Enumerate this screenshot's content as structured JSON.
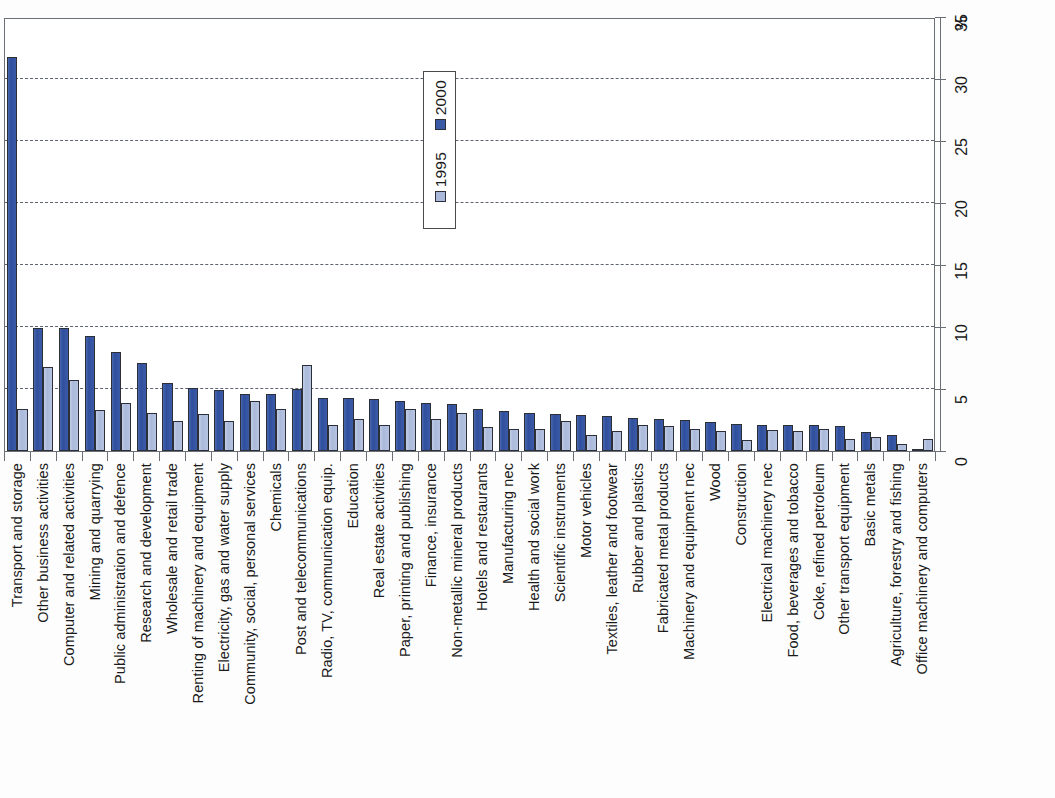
{
  "chart_data": {
    "type": "bar",
    "title": "",
    "subtitle": "",
    "xlabel": "",
    "ylabel": "%",
    "ylim": [
      0,
      35
    ],
    "yticks": [
      0,
      5,
      10,
      15,
      20,
      25,
      30,
      35
    ],
    "ytick_labels": [
      "0",
      "5",
      "10",
      "15",
      "20",
      "25",
      "30",
      "35"
    ],
    "grid": true,
    "grid_axis": "y",
    "orientation": "vertical-rotated-labels",
    "legend": {
      "position": "top-center-inside",
      "entries": [
        {
          "name": "2000",
          "color": "#3b5aa6"
        },
        {
          "name": "1995",
          "color": "#aab9da"
        }
      ]
    },
    "categories": [
      "Transport and storage",
      "Other business activities",
      "Computer and related activities",
      "Mining and quarrying",
      "Public administration and defence",
      "Research and development",
      "Wholesale and retail trade",
      "Renting of machinery and equipment",
      "Electricity, gas and water supply",
      "Community, social, personal services",
      "Chemicals",
      "Post and telecommunications",
      "Radio, TV, communication equip.",
      "Education",
      "Real estate activities",
      "Paper, printing and publishing",
      "Finance, insurance",
      "Non-metallic mineral products",
      "Hotels and restaurants",
      "Manufacturing nec",
      "Health and social work",
      "Scientific instruments",
      "Motor vehicles",
      "Textiles, leather and footwear",
      "Rubber and plastics",
      "Fabricated metal products",
      "Machinery and equipment nec",
      "Wood",
      "Construction",
      "Electrical machinery nec",
      "Food, beverages and tobacco",
      "Coke, refined petroleum",
      "Other transport equipment",
      "Basic metals",
      "Agriculture, forestry and fishing",
      "Office machinery and computers"
    ],
    "series": [
      {
        "name": "2000",
        "color": "#3b5aa6",
        "values": [
          31.8,
          9.9,
          9.9,
          9.3,
          8.0,
          7.1,
          5.5,
          5.1,
          4.9,
          4.6,
          4.6,
          5.0,
          4.3,
          4.3,
          4.2,
          4.0,
          3.9,
          3.8,
          3.4,
          3.2,
          3.1,
          3.0,
          2.9,
          2.8,
          2.7,
          2.6,
          2.5,
          2.3,
          2.2,
          2.1,
          2.1,
          2.1,
          2.0,
          1.5,
          1.3,
          0.2
        ]
      },
      {
        "name": "1995",
        "color": "#aab9da",
        "values": [
          3.4,
          6.8,
          5.7,
          3.3,
          3.9,
          3.1,
          2.4,
          3.0,
          2.4,
          4.0,
          3.4,
          6.9,
          2.1,
          2.6,
          2.1,
          3.4,
          2.6,
          3.1,
          1.9,
          1.8,
          1.8,
          2.4,
          1.3,
          1.6,
          2.1,
          2.0,
          1.8,
          1.6,
          0.9,
          1.7,
          1.6,
          1.8,
          1.0,
          1.1,
          0.6,
          1.0
        ]
      }
    ]
  },
  "axis": {
    "unit_label": "%"
  }
}
